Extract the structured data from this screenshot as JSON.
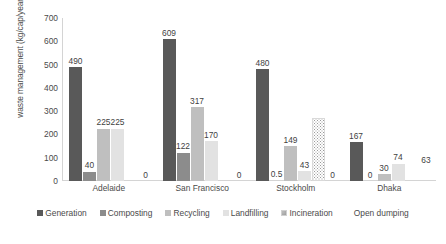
{
  "chart_data": {
    "type": "bar",
    "title": "",
    "xlabel": "",
    "ylabel": "waste management (kg/cap/year)",
    "ylim": [
      0,
      700
    ],
    "ytick_step": 100,
    "yticks": [
      "700",
      "600",
      "500",
      "400",
      "300",
      "200",
      "100",
      "0"
    ],
    "grid": false,
    "legend_position": "bottom",
    "categories": [
      "Adelaide",
      "San Francisco",
      "Stockholm",
      "Dhaka"
    ],
    "series": [
      {
        "name": "Generation",
        "color": "#595959",
        "pattern": "solid",
        "values": [
          490,
          609,
          480,
          167
        ],
        "labels": [
          "490",
          "609",
          "480",
          "167"
        ]
      },
      {
        "name": "Composting",
        "color": "#8c8c8c",
        "pattern": "solid",
        "values": [
          40,
          122,
          0.5,
          0
        ],
        "labels": [
          "40",
          "122",
          "0.5",
          "0"
        ]
      },
      {
        "name": "Recycling",
        "color": "#bfbfbf",
        "pattern": "solid",
        "values": [
          225,
          317,
          149,
          30
        ],
        "labels": [
          "225",
          "317",
          "149",
          "30"
        ]
      },
      {
        "name": "Landfilling",
        "color": "#e2e2e2",
        "pattern": "solid",
        "values": [
          225,
          170,
          43,
          74
        ],
        "labels": [
          "225",
          "170",
          "43",
          "74"
        ]
      },
      {
        "name": "Incineration",
        "color": "#9a9a9a",
        "pattern": "dotted",
        "values": [
          0,
          0,
          270,
          0
        ],
        "labels": [
          "",
          "",
          "",
          ""
        ]
      },
      {
        "name": "Open dumping",
        "color": "#6b6b6b",
        "pattern": "horizontal-lines",
        "values": [
          0,
          0,
          0,
          63
        ],
        "labels": [
          "0",
          "0",
          "0",
          "63"
        ]
      }
    ]
  },
  "legend": {
    "items": [
      {
        "label": "Generation"
      },
      {
        "label": "Composting"
      },
      {
        "label": "Recycling"
      },
      {
        "label": "Landfilling"
      },
      {
        "label": "Incineration"
      },
      {
        "label": "Open dumping"
      }
    ]
  }
}
